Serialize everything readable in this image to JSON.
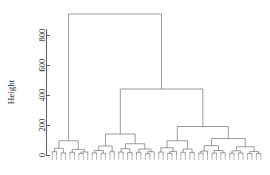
{
  "chart_data": {
    "type": "dendrogram",
    "title": "",
    "subtitle": "",
    "xlabel": "",
    "ylabel": "Height",
    "ylim": [
      0,
      940
    ],
    "yticks": [
      0,
      200,
      400,
      600,
      800
    ],
    "ytick_labels": [
      "0",
      "200",
      "400",
      "600",
      "800"
    ],
    "grid": false,
    "legend": null,
    "orientation": "vertical",
    "n_leaves": 60,
    "linkage_note": "hierarchical clustering tree; leaf labels rendered too small to read",
    "leaf_labels_readable": false,
    "merges": [
      {
        "id": "root",
        "height": 940,
        "left": "A",
        "right": "B"
      },
      {
        "id": "B",
        "height": 440,
        "left": "B1",
        "right": "B2"
      },
      {
        "id": "B2",
        "height": 190,
        "left": "B2a",
        "right": "B2b"
      },
      {
        "id": "A",
        "height": 95,
        "left": "A1",
        "right": "A2"
      },
      {
        "id": "B1",
        "height": 140,
        "left": "B1a",
        "right": "B1b"
      },
      {
        "id": "B1b",
        "height": 75,
        "left": "B1b1",
        "right": "B1b2"
      },
      {
        "id": "B2a",
        "height": 95,
        "left": "B2a1",
        "right": "B2a2"
      },
      {
        "id": "B2b",
        "height": 110,
        "left": "B2b1",
        "right": "B2b2"
      }
    ],
    "structure": {
      "h": 940,
      "children": [
        {
          "h": 95,
          "children": [
            {
              "h": 45,
              "children": [
                {
                  "h": 22,
                  "children": [
                    {
                      "h": 0
                    },
                    {
                      "h": 0
                    }
                  ]
                },
                {
                  "h": 14,
                  "children": [
                    {
                      "h": 0
                    },
                    {
                      "h": 0
                    }
                  ]
                }
              ]
            },
            {
              "h": 38,
              "children": [
                {
                  "h": 18,
                  "children": [
                    {
                      "h": 0
                    },
                    {
                      "h": 0
                    }
                  ]
                },
                {
                  "h": 20,
                  "children": [
                    {
                      "h": 10,
                      "children": [
                        {
                          "h": 0
                        },
                        {
                          "h": 0
                        }
                      ]
                    },
                    {
                      "h": 0
                    }
                  ]
                }
              ]
            }
          ]
        },
        {
          "h": 440,
          "children": [
            {
              "h": 140,
              "children": [
                {
                  "h": 60,
                  "children": [
                    {
                      "h": 30,
                      "children": [
                        {
                          "h": 14,
                          "children": [
                            {
                              "h": 0
                            },
                            {
                              "h": 0
                            }
                          ]
                        },
                        {
                          "h": 12,
                          "children": [
                            {
                              "h": 0
                            },
                            {
                              "h": 0
                            }
                          ]
                        }
                      ]
                    },
                    {
                      "h": 22,
                      "children": [
                        {
                          "h": 0
                        },
                        {
                          "h": 0
                        }
                      ]
                    }
                  ]
                },
                {
                  "h": 75,
                  "children": [
                    {
                      "h": 42,
                      "children": [
                        {
                          "h": 20,
                          "children": [
                            {
                              "h": 0
                            },
                            {
                              "h": 0
                            }
                          ]
                        },
                        {
                          "h": 16,
                          "children": [
                            {
                              "h": 0
                            },
                            {
                              "h": 0
                            }
                          ]
                        }
                      ]
                    },
                    {
                      "h": 40,
                      "children": [
                        {
                          "h": 18,
                          "children": [
                            {
                              "h": 0
                            },
                            {
                              "h": 0
                            }
                          ]
                        },
                        {
                          "h": 22,
                          "children": [
                            {
                              "h": 9,
                              "children": [
                                {
                                  "h": 0
                                },
                                {
                                  "h": 0
                                }
                              ]
                            },
                            {
                              "h": 0
                            }
                          ]
                        }
                      ]
                    }
                  ]
                }
              ]
            },
            {
              "h": 190,
              "children": [
                {
                  "h": 95,
                  "children": [
                    {
                      "h": 48,
                      "children": [
                        {
                          "h": 20,
                          "children": [
                            {
                              "h": 0
                            },
                            {
                              "h": 0
                            }
                          ]
                        },
                        {
                          "h": 24,
                          "children": [
                            {
                              "h": 11,
                              "children": [
                                {
                                  "h": 0
                                },
                                {
                                  "h": 0
                                }
                              ]
                            },
                            {
                              "h": 0
                            }
                          ]
                        }
                      ]
                    },
                    {
                      "h": 40,
                      "children": [
                        {
                          "h": 18,
                          "children": [
                            {
                              "h": 0
                            },
                            {
                              "h": 0
                            }
                          ]
                        },
                        {
                          "h": 16,
                          "children": [
                            {
                              "h": 0
                            },
                            {
                              "h": 0
                            }
                          ]
                        }
                      ]
                    }
                  ]
                },
                {
                  "h": 110,
                  "children": [
                    {
                      "h": 62,
                      "children": [
                        {
                          "h": 26,
                          "children": [
                            {
                              "h": 12,
                              "children": [
                                {
                                  "h": 0
                                },
                                {
                                  "h": 0
                                }
                              ]
                            },
                            {
                              "h": 0
                            }
                          ]
                        },
                        {
                          "h": 30,
                          "children": [
                            {
                              "h": 13,
                              "children": [
                                {
                                  "h": 0
                                },
                                {
                                  "h": 0
                                }
                              ]
                            },
                            {
                              "h": 15,
                              "children": [
                                {
                                  "h": 0
                                },
                                {
                                  "h": 0
                                }
                              ]
                            }
                          ]
                        }
                      ]
                    },
                    {
                      "h": 55,
                      "children": [
                        {
                          "h": 28,
                          "children": [
                            {
                              "h": 12,
                              "children": [
                                {
                                  "h": 0
                                },
                                {
                                  "h": 0
                                }
                              ]
                            },
                            {
                              "h": 14,
                              "children": [
                                {
                                  "h": 0
                                },
                                {
                                  "h": 0
                                }
                              ]
                            }
                          ]
                        },
                        {
                          "h": 24,
                          "children": [
                            {
                              "h": 10,
                              "children": [
                                {
                                  "h": 0
                                },
                                {
                                  "h": 0
                                }
                              ]
                            },
                            {
                              "h": 11,
                              "children": [
                                {
                                  "h": 0
                                },
                                {
                                  "h": 0
                                }
                              ]
                            }
                          ]
                        }
                      ]
                    }
                  ]
                }
              ]
            }
          ]
        }
      ]
    },
    "colors": {
      "line": "#7a7a7a",
      "axis": "#4d4d4d",
      "text": "#1a1a1a",
      "background": "#ffffff"
    }
  },
  "plot": {
    "area": {
      "left": 50,
      "right": 263,
      "top": 14,
      "bottom": 155
    }
  }
}
